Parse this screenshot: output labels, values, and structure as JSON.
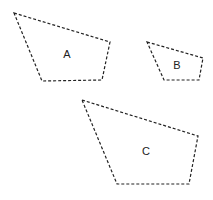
{
  "diagram": {
    "shapes": [
      {
        "id": "A",
        "label": "A",
        "points": "14,13 110,42 102,80 42,81",
        "label_pos": [
          67,
          55
        ]
      },
      {
        "id": "B",
        "label": "B",
        "points": "147,42 203,58 199,80 164,80",
        "label_pos": [
          177,
          66
        ]
      },
      {
        "id": "C",
        "label": "C",
        "points": "82,100 198,136 189,184 117,184",
        "label_pos": [
          146,
          152
        ]
      }
    ],
    "stroke_color": "#222222",
    "background": "#ffffff"
  }
}
